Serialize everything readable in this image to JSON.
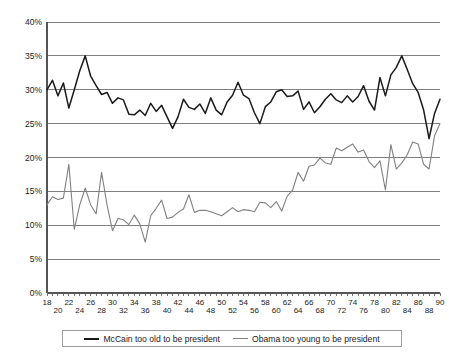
{
  "chart_data": {
    "type": "line",
    "title": "",
    "subtitle": "",
    "xlabel": "",
    "ylabel": "",
    "xlim": [
      18,
      90
    ],
    "ylim": [
      0,
      40
    ],
    "grid": true,
    "legend_position": "bottom",
    "y_ticks": [
      0,
      5,
      10,
      15,
      20,
      25,
      30,
      35,
      40
    ],
    "y_tick_labels": [
      "0%",
      "5%",
      "10%",
      "15%",
      "20%",
      "25%",
      "30%",
      "35%",
      "40%"
    ],
    "x_ticks": [
      18,
      20,
      22,
      24,
      26,
      28,
      30,
      32,
      34,
      36,
      38,
      40,
      42,
      44,
      46,
      48,
      50,
      52,
      54,
      56,
      58,
      60,
      62,
      64,
      66,
      68,
      70,
      72,
      74,
      76,
      78,
      80,
      82,
      84,
      86,
      88,
      90
    ],
    "x_tick_labels": [
      "18",
      "20",
      "22",
      "24",
      "26",
      "28",
      "30",
      "32",
      "34",
      "36",
      "38",
      "40",
      "42",
      "44",
      "46",
      "48",
      "50",
      "52",
      "54",
      "56",
      "58",
      "60",
      "62",
      "64",
      "66",
      "68",
      "70",
      "72",
      "74",
      "76",
      "78",
      "80",
      "82",
      "84",
      "86",
      "88",
      "90"
    ],
    "x": [
      18,
      19,
      20,
      21,
      22,
      23,
      24,
      25,
      26,
      27,
      28,
      29,
      30,
      31,
      32,
      33,
      34,
      35,
      36,
      37,
      38,
      39,
      40,
      41,
      42,
      43,
      44,
      45,
      46,
      47,
      48,
      49,
      50,
      51,
      52,
      53,
      54,
      55,
      56,
      57,
      58,
      59,
      60,
      61,
      62,
      63,
      64,
      65,
      66,
      67,
      68,
      69,
      70,
      71,
      72,
      73,
      74,
      75,
      76,
      77,
      78,
      79,
      80,
      81,
      82,
      83,
      84,
      85,
      86,
      87,
      88,
      89,
      90
    ],
    "series": [
      {
        "name": "McCain too old to be president",
        "color": "#1a1a1a",
        "values": [
          30.0,
          31.4,
          29.1,
          31.0,
          27.3,
          30.0,
          32.8,
          35.0,
          32.0,
          30.6,
          29.3,
          29.6,
          28.0,
          28.8,
          28.5,
          26.4,
          26.3,
          27.0,
          26.2,
          28.0,
          26.8,
          27.7,
          26.0,
          24.3,
          26.0,
          28.6,
          27.4,
          27.1,
          27.9,
          26.5,
          28.8,
          27.0,
          26.3,
          28.2,
          29.2,
          31.1,
          29.2,
          28.7,
          26.6,
          25.0,
          27.5,
          28.2,
          29.7,
          30.0,
          29.0,
          29.1,
          29.8,
          27.1,
          28.2,
          26.6,
          27.5,
          28.6,
          29.4,
          28.5,
          28.1,
          29.1,
          28.2,
          29.0,
          30.6,
          28.3,
          27.0,
          31.8,
          29.1,
          32.2,
          33.3,
          35.0,
          33.0,
          30.9,
          29.6,
          27.0,
          22.8,
          26.5,
          28.6
        ]
      },
      {
        "name": "Obama too young to be president",
        "color": "#808080",
        "values": [
          13.0,
          14.2,
          13.8,
          14.0,
          19.0,
          9.4,
          13.0,
          15.5,
          13.0,
          11.7,
          17.8,
          13.0,
          9.2,
          11.0,
          10.8,
          10.1,
          11.5,
          10.2,
          7.5,
          11.4,
          12.5,
          13.7,
          11.0,
          11.2,
          11.9,
          12.4,
          14.5,
          11.9,
          12.2,
          12.2,
          12.0,
          11.7,
          11.4,
          12.0,
          12.6,
          12.0,
          12.3,
          12.2,
          12.0,
          13.4,
          13.3,
          12.6,
          13.5,
          12.1,
          14.3,
          15.2,
          17.8,
          16.5,
          18.7,
          18.9,
          19.9,
          19.2,
          19.0,
          21.4,
          21.0,
          21.5,
          22.0,
          20.8,
          21.1,
          19.4,
          18.5,
          19.5,
          15.2,
          21.9,
          18.3,
          19.2,
          20.4,
          22.3,
          22.0,
          19.0,
          18.3,
          23.2,
          25.0
        ]
      }
    ]
  },
  "legend": {
    "entries": [
      {
        "label": "McCain too old to be president",
        "color": "#1a1a1a"
      },
      {
        "label": "Obama too young to be president",
        "color": "#808080"
      }
    ]
  }
}
